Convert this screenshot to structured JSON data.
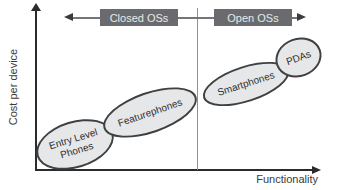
{
  "figure": {
    "type": "conceptual-positioning-diagram",
    "axes": {
      "y_label": "Cost per device",
      "x_label": "Functionality"
    },
    "top_bar": {
      "closed_label": "Closed OSs",
      "open_label": "Open OSs"
    },
    "groups": [
      {
        "label": "Entry Level\nPhones",
        "os_side": "closed"
      },
      {
        "label": "Featurephones",
        "os_side": "closed"
      },
      {
        "label": "Smartphones",
        "os_side": "open"
      },
      {
        "label": "PDAs",
        "os_side": "open"
      }
    ],
    "colors": {
      "os_box_fill": "#6a6b6e",
      "os_box_text": "#e8e9e9",
      "bubble_fill": "#e6e7e8",
      "bubble_border": "#3f4042",
      "axis": "#2b2b2d",
      "divider": "#8f9194",
      "background": "#ffffff"
    }
  }
}
